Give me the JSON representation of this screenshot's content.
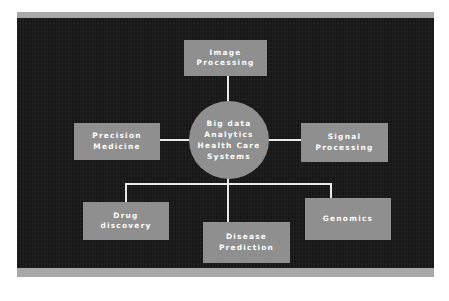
{
  "diagram": {
    "hub": {
      "id": "hub",
      "label": "Big data\nAnalytics\nHealth Care\nSystems",
      "shape": "ellipse"
    },
    "nodes": [
      {
        "id": "image-processing",
        "label": "Image\nProcessing",
        "position": "top"
      },
      {
        "id": "precision-medicine",
        "label": "Precision\nMedicine",
        "position": "left"
      },
      {
        "id": "signal-processing",
        "label": "Signal\nProcessing",
        "position": "right"
      },
      {
        "id": "drug-discovery",
        "label": "Drug\ndiscovery",
        "position": "bottom-left"
      },
      {
        "id": "disease-prediction",
        "label": "Disease\nPrediction",
        "position": "bottom-center"
      },
      {
        "id": "genomics",
        "label": "Genomics",
        "position": "bottom-right"
      }
    ],
    "colors": {
      "canvas_background": "#171717",
      "plate": "#a8a8a8",
      "node_fill": "#8f8f8f",
      "node_text": "#ffffff",
      "connector": "#e9e9e9",
      "page_background": "#ffffff"
    }
  }
}
